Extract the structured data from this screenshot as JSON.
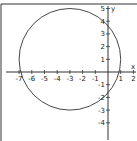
{
  "chart_data": {
    "type": "line",
    "title": "",
    "xlabel": "x",
    "ylabel": "y",
    "xlim": [
      -7.5,
      2
    ],
    "ylim": [
      -5,
      5
    ],
    "x_ticks": [
      "-7",
      "-6",
      "-5",
      "-4",
      "-3",
      "-2",
      "-1",
      "1",
      "2"
    ],
    "y_ticks": [
      "5",
      "4",
      "3",
      "2",
      "1",
      "-1",
      "-2",
      "-3",
      "-4"
    ],
    "grid": false,
    "series": [
      {
        "name": "circle",
        "shape": "circle",
        "center": [
          -3,
          1
        ],
        "radius": 4
      }
    ]
  },
  "axes": {
    "x_label": "x",
    "y_label": "y"
  }
}
